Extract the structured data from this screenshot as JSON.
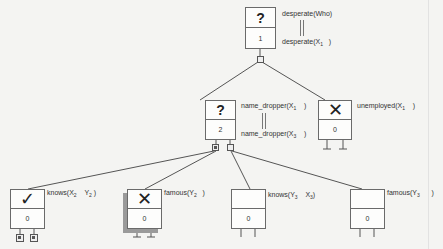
{
  "nodes": {
    "root": {
      "status": "?",
      "count": "1",
      "goal": "desperate(Who)",
      "head": "desperate(X",
      "head_sub": "1",
      "head_close": ")"
    },
    "name_dropper": {
      "status": "?",
      "count": "2",
      "goal": "name_dropper(X",
      "goal_sub": "1",
      "goal_close": ")",
      "head": "name_dropper(X",
      "head_sub": "3",
      "head_close": ")"
    },
    "unemployed": {
      "status": "✕",
      "count": "0",
      "goal": "unemployed(X",
      "goal_sub": "1",
      "goal_close": ")"
    },
    "knows_x2_y2": {
      "status": "✓",
      "count": "0",
      "goal": "knows(X",
      "goal_sub": "2",
      "goal_mid": "Y",
      "goal_sub2": "2",
      "goal_close": ")"
    },
    "famous_y2": {
      "status": "✕",
      "count": "0",
      "goal": "famous(Y",
      "goal_sub": "2",
      "goal_close": ")"
    },
    "knows_y3_x3": {
      "status": "",
      "count": "0",
      "goal": "knows(Y",
      "goal_sub": "3",
      "goal_mid": "X",
      "goal_sub2": "3",
      "goal_close": ")"
    },
    "famous_y3": {
      "status": "",
      "count": "0",
      "goal": "famous(Y",
      "goal_sub": "3",
      "goal_close": ")"
    }
  },
  "colors": {
    "background": "#f4f4f2",
    "line": "#555555",
    "shadow": "#9a9a9a"
  }
}
